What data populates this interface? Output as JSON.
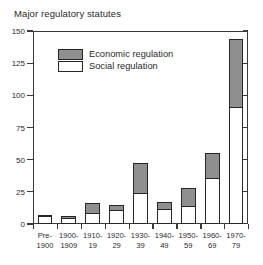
{
  "chart_data": {
    "type": "bar",
    "stacked": true,
    "title": "Major regulatory statutes",
    "xlabel": "",
    "ylabel": "",
    "ylim": [
      0,
      150
    ],
    "yticks": [
      0,
      25,
      50,
      75,
      100,
      125,
      150
    ],
    "ytick_labels": [
      "0",
      "25",
      "50",
      "75",
      "100",
      "125",
      "150"
    ],
    "grid": false,
    "legend_position": "upper-left-inside",
    "categories": [
      "Pre-1900",
      "1900-1909",
      "1910-19",
      "1920-29",
      "1930-39",
      "1940-49",
      "1950-59",
      "1960-69",
      "1970-79"
    ],
    "category_lines": [
      [
        "Pre-",
        "1900"
      ],
      [
        "1900-",
        "1909"
      ],
      [
        "1910-",
        "19"
      ],
      [
        "1920-",
        "29"
      ],
      [
        "1930-",
        "39"
      ],
      [
        "1940-",
        "49"
      ],
      [
        "1950-",
        "59"
      ],
      [
        "1960-",
        "69"
      ],
      [
        "1970-",
        "79"
      ]
    ],
    "series": [
      {
        "name": "Social regulation",
        "color": "#ffffff",
        "values": [
          6,
          5,
          9,
          11,
          24,
          12,
          14,
          36,
          91
        ]
      },
      {
        "name": "Economic regulation",
        "color": "#8f8f8f",
        "values": [
          2,
          2,
          8,
          5,
          24,
          6,
          15,
          20,
          54
        ]
      }
    ],
    "totals": [
      8,
      7,
      17,
      16,
      48,
      18,
      29,
      56,
      145
    ],
    "legend": [
      {
        "label": "Economic regulation",
        "color": "#8f8f8f"
      },
      {
        "label": "Social regulation",
        "color": "#ffffff"
      }
    ]
  },
  "colors": {
    "axis": "#3a3a3a",
    "bar_outline": "#262626",
    "economic_fill": "#8f8f8f",
    "social_fill": "#ffffff",
    "background": "#ffffff",
    "text": "#2a2a2a"
  }
}
